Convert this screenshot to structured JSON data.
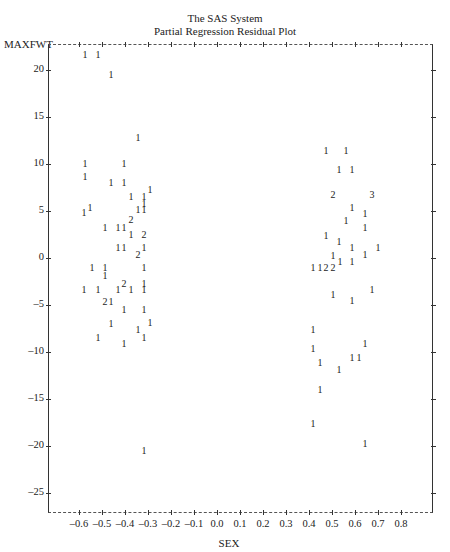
{
  "header": {
    "title": "The SAS System",
    "subtitle": "Partial Regression Residual Plot"
  },
  "axes": {
    "ylabel": "MAXFWT",
    "xlabel": "SEX"
  },
  "chart_data": {
    "type": "scatter",
    "xlabel": "SEX",
    "ylabel": "MAXFWT",
    "xlim": [
      -0.73,
      0.95
    ],
    "ylim": [
      -27.5,
      22.8
    ],
    "grid": false,
    "legend": "none (plot symbols are observation counts: 1, 2, 3)",
    "x_ticks": [
      "-0.6",
      "-0.5",
      "-0.4",
      "-0.3",
      "-0.2",
      "-0.1",
      "0.0",
      "0.1",
      "0.2",
      "0.3",
      "0.4",
      "0.5",
      "0.6",
      "0.7",
      "0.8"
    ],
    "y_ticks": [
      "20",
      "15",
      "10",
      "5",
      "0",
      "-5",
      "-10",
      "-15",
      "-20",
      "-25"
    ],
    "points": [
      {
        "x": -0.574,
        "y": 21.6,
        "label": "1"
      },
      {
        "x": -0.517,
        "y": 21.6,
        "label": "1"
      },
      {
        "x": -0.461,
        "y": 19.5,
        "label": "1"
      },
      {
        "x": -0.343,
        "y": 12.8,
        "label": "1"
      },
      {
        "x": -0.574,
        "y": 10.0,
        "label": "1"
      },
      {
        "x": -0.404,
        "y": 10.0,
        "label": "1"
      },
      {
        "x": -0.574,
        "y": 8.6,
        "label": "1"
      },
      {
        "x": -0.461,
        "y": 8.0,
        "label": "1"
      },
      {
        "x": -0.404,
        "y": 8.0,
        "label": "1"
      },
      {
        "x": -0.291,
        "y": 7.2,
        "label": "1"
      },
      {
        "x": -0.374,
        "y": 6.5,
        "label": "1"
      },
      {
        "x": -0.317,
        "y": 6.5,
        "label": "1"
      },
      {
        "x": -0.317,
        "y": 5.7,
        "label": "1"
      },
      {
        "x": -0.552,
        "y": 5.3,
        "label": "1"
      },
      {
        "x": -0.578,
        "y": 4.8,
        "label": "1"
      },
      {
        "x": -0.343,
        "y": 5.1,
        "label": "1"
      },
      {
        "x": -0.317,
        "y": 5.1,
        "label": "1"
      },
      {
        "x": -0.374,
        "y": 4.0,
        "label": "2"
      },
      {
        "x": -0.487,
        "y": 3.2,
        "label": "1"
      },
      {
        "x": -0.43,
        "y": 3.2,
        "label": "1"
      },
      {
        "x": -0.404,
        "y": 3.2,
        "label": "1"
      },
      {
        "x": -0.374,
        "y": 2.4,
        "label": "1"
      },
      {
        "x": -0.317,
        "y": 2.4,
        "label": "2"
      },
      {
        "x": -0.43,
        "y": 1.1,
        "label": "1"
      },
      {
        "x": -0.404,
        "y": 1.1,
        "label": "1"
      },
      {
        "x": -0.343,
        "y": 0.3,
        "label": "2"
      },
      {
        "x": -0.317,
        "y": 1.1,
        "label": "1"
      },
      {
        "x": -0.543,
        "y": -1.1,
        "label": "1"
      },
      {
        "x": -0.487,
        "y": -1.1,
        "label": "1"
      },
      {
        "x": -0.487,
        "y": -1.9,
        "label": "1"
      },
      {
        "x": -0.317,
        "y": -1.1,
        "label": "1"
      },
      {
        "x": -0.578,
        "y": -3.4,
        "label": "1"
      },
      {
        "x": -0.517,
        "y": -3.4,
        "label": "1"
      },
      {
        "x": -0.43,
        "y": -3.4,
        "label": "1"
      },
      {
        "x": -0.404,
        "y": -2.8,
        "label": "2"
      },
      {
        "x": -0.374,
        "y": -3.4,
        "label": "1"
      },
      {
        "x": -0.317,
        "y": -2.8,
        "label": "1"
      },
      {
        "x": -0.317,
        "y": -3.4,
        "label": "1"
      },
      {
        "x": -0.487,
        "y": -4.7,
        "label": "2"
      },
      {
        "x": -0.461,
        "y": -4.7,
        "label": "1"
      },
      {
        "x": -0.404,
        "y": -5.5,
        "label": "1"
      },
      {
        "x": -0.317,
        "y": -5.5,
        "label": "1"
      },
      {
        "x": -0.461,
        "y": -7.0,
        "label": "1"
      },
      {
        "x": -0.291,
        "y": -6.9,
        "label": "1"
      },
      {
        "x": -0.343,
        "y": -7.7,
        "label": "1"
      },
      {
        "x": -0.517,
        "y": -8.5,
        "label": "1"
      },
      {
        "x": -0.404,
        "y": -9.1,
        "label": "1"
      },
      {
        "x": -0.317,
        "y": -8.5,
        "label": "1"
      },
      {
        "x": -0.317,
        "y": -20.5,
        "label": "1"
      },
      {
        "x": 0.474,
        "y": 11.4,
        "label": "1"
      },
      {
        "x": 0.561,
        "y": 11.4,
        "label": "1"
      },
      {
        "x": 0.53,
        "y": 9.4,
        "label": "1"
      },
      {
        "x": 0.587,
        "y": 9.4,
        "label": "1"
      },
      {
        "x": 0.504,
        "y": 6.7,
        "label": "2"
      },
      {
        "x": 0.674,
        "y": 6.7,
        "label": "3"
      },
      {
        "x": 0.587,
        "y": 5.3,
        "label": "1"
      },
      {
        "x": 0.643,
        "y": 4.7,
        "label": "1"
      },
      {
        "x": 0.561,
        "y": 3.9,
        "label": "1"
      },
      {
        "x": 0.643,
        "y": 3.2,
        "label": "1"
      },
      {
        "x": 0.474,
        "y": 2.3,
        "label": "1"
      },
      {
        "x": 0.53,
        "y": 1.7,
        "label": "1"
      },
      {
        "x": 0.587,
        "y": 1.1,
        "label": "1"
      },
      {
        "x": 0.7,
        "y": 1.1,
        "label": "1"
      },
      {
        "x": 0.504,
        "y": 0.2,
        "label": "1"
      },
      {
        "x": 0.643,
        "y": 0.3,
        "label": "1"
      },
      {
        "x": 0.417,
        "y": -1.1,
        "label": "1"
      },
      {
        "x": 0.448,
        "y": -1.1,
        "label": "1"
      },
      {
        "x": 0.474,
        "y": -1.1,
        "label": "2"
      },
      {
        "x": 0.504,
        "y": -1.1,
        "label": "2"
      },
      {
        "x": 0.535,
        "y": -0.4,
        "label": "1"
      },
      {
        "x": 0.587,
        "y": -0.4,
        "label": "1"
      },
      {
        "x": 0.674,
        "y": -3.4,
        "label": "1"
      },
      {
        "x": 0.504,
        "y": -3.9,
        "label": "1"
      },
      {
        "x": 0.587,
        "y": -4.6,
        "label": "1"
      },
      {
        "x": 0.417,
        "y": -7.7,
        "label": "1"
      },
      {
        "x": 0.643,
        "y": -9.1,
        "label": "1"
      },
      {
        "x": 0.417,
        "y": -9.7,
        "label": "1"
      },
      {
        "x": 0.587,
        "y": -10.6,
        "label": "1"
      },
      {
        "x": 0.617,
        "y": -10.6,
        "label": "1"
      },
      {
        "x": 0.448,
        "y": -11.2,
        "label": "1"
      },
      {
        "x": 0.53,
        "y": -11.9,
        "label": "1"
      },
      {
        "x": 0.448,
        "y": -14.0,
        "label": "1"
      },
      {
        "x": 0.417,
        "y": -17.7,
        "label": "1"
      },
      {
        "x": 0.643,
        "y": -19.8,
        "label": "1"
      }
    ]
  }
}
